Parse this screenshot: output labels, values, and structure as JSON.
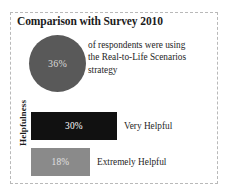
{
  "title": "Comparison with Survey 2010",
  "circle_stat": {
    "value": "36%",
    "description_lines": [
      "of respondents were using",
      "the Real-to-Life Scenarios",
      "strategy"
    ],
    "fill_color": "#595959",
    "text_color": "#d9d9d9"
  },
  "axis": {
    "label": "Helpfulness"
  },
  "bars": [
    {
      "value": "30%",
      "caption": "Very Helpful",
      "color": "#111111"
    },
    {
      "value": "18%",
      "caption": "Extremely Helpful",
      "color": "#8a8a8a"
    }
  ],
  "chart_data": {
    "type": "bar",
    "title": "Comparison with Survey 2010",
    "categories": [
      "Very Helpful",
      "Extremely Helpful"
    ],
    "values": [
      30,
      18
    ],
    "value_labels": [
      "30%",
      "18%"
    ],
    "series": [
      {
        "name": "Helpfulness",
        "values": [
          30,
          18
        ]
      }
    ],
    "xlabel": "",
    "ylabel": "Helpfulness",
    "xlim": [
      0,
      100
    ],
    "grid": false,
    "legend": "none",
    "orientation": "horizontal",
    "bar_colors": [
      "#111111",
      "#8a8a8a"
    ],
    "annotations": [
      {
        "type": "circle-stat",
        "value": 36,
        "value_label": "36%",
        "text": "of respondents were using the Real-to-Life Scenarios strategy",
        "color": "#595959"
      }
    ]
  }
}
